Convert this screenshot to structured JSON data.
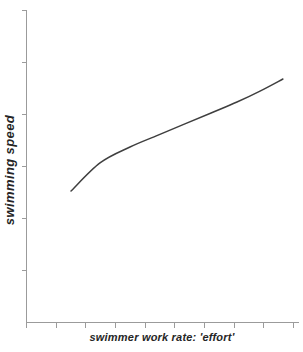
{
  "chart_data": {
    "type": "line",
    "title": "",
    "xlabel": "swimmer work rate: 'effort'",
    "ylabel": "swimming speed",
    "grid": false,
    "legend": false,
    "x_ticks": {
      "count": 10,
      "labels": []
    },
    "y_ticks": {
      "count": 6,
      "labels": []
    },
    "axis_note": "both axes unlabeled qualitative scales with tick marks only",
    "series": [
      {
        "name": "swimming-speed-vs-effort",
        "coords": "normalized 0-1 fractions of plot area, y measured upward",
        "points": [
          [
            0.165,
            0.42
          ],
          [
            0.271,
            0.51
          ],
          [
            0.381,
            0.561
          ],
          [
            0.484,
            0.599
          ],
          [
            0.582,
            0.635
          ],
          [
            0.678,
            0.67
          ],
          [
            0.773,
            0.705
          ],
          [
            0.857,
            0.74
          ],
          [
            0.941,
            0.779
          ]
        ]
      }
    ]
  },
  "colors": {
    "background": "#ffffff",
    "axis": "#9b9b9b",
    "curve": "#3f3f3f",
    "label": "#262626"
  }
}
